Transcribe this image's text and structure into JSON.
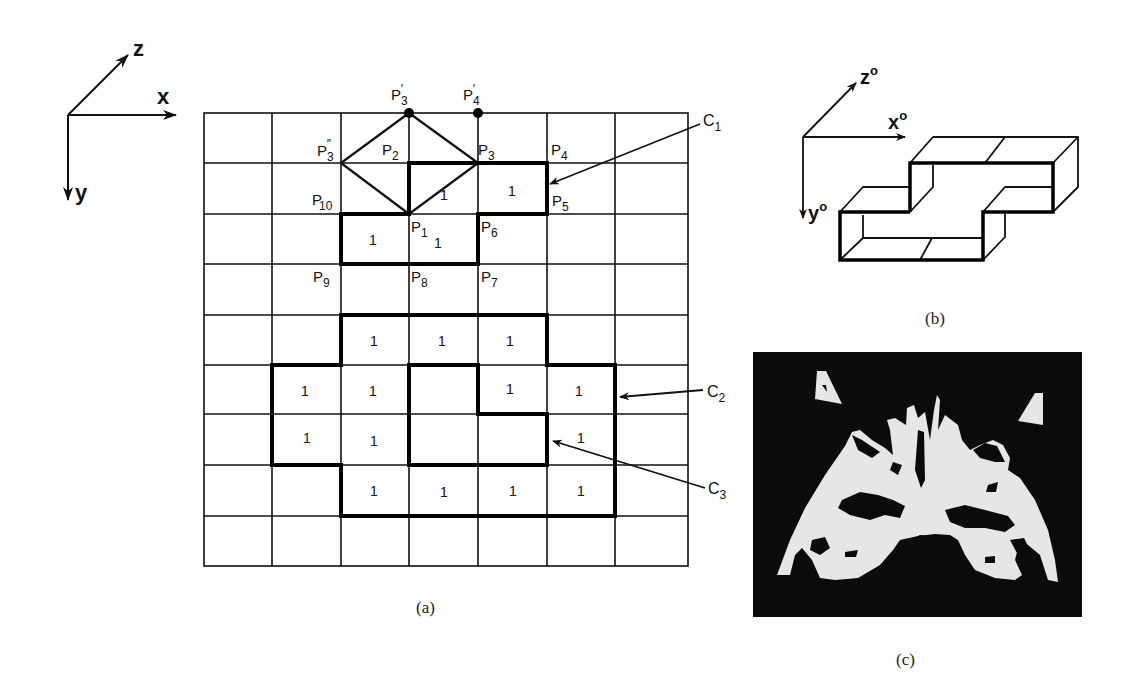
{
  "figure": {
    "panel_a": {
      "caption": "(a)",
      "axes": {
        "x": "x",
        "y": "y",
        "z": "z"
      },
      "grid": {
        "cols": 7,
        "rows": 9,
        "x_lines": [
          204,
          272,
          341,
          409,
          478,
          547,
          615,
          688
        ],
        "y_lines": [
          113,
          163,
          214,
          264,
          315,
          365,
          414,
          465,
          516,
          566
        ]
      },
      "points": {
        "P3_prime": "P",
        "P3_prime_sub": "3",
        "P3_prime_mark": "′",
        "P4_prime": "P",
        "P4_prime_sub": "4",
        "P4_prime_mark": "′",
        "P3_dprime": "P",
        "P3_dprime_sub": "3",
        "P3_dprime_mark": "″",
        "P1": "P",
        "P1_sub": "1",
        "P2": "P",
        "P2_sub": "2",
        "P3": "P",
        "P3_sub": "3",
        "P4": "P",
        "P4_sub": "4",
        "P5": "P",
        "P5_sub": "5",
        "P6": "P",
        "P6_sub": "6",
        "P7": "P",
        "P7_sub": "7",
        "P8": "P",
        "P8_sub": "8",
        "P9": "P",
        "P9_sub": "9",
        "P10": "P",
        "P10_sub": "10"
      },
      "cell_value": "1",
      "cells_marked": [
        [
          1,
          3
        ],
        [
          1,
          4
        ],
        [
          2,
          2
        ],
        [
          2,
          3
        ],
        [
          4,
          2
        ],
        [
          4,
          3
        ],
        [
          4,
          4
        ],
        [
          5,
          1
        ],
        [
          5,
          2
        ],
        [
          5,
          4
        ],
        [
          5,
          5
        ],
        [
          6,
          1
        ],
        [
          6,
          2
        ],
        [
          6,
          5
        ],
        [
          7,
          2
        ],
        [
          7,
          3
        ],
        [
          7,
          4
        ],
        [
          7,
          5
        ]
      ],
      "contours": {
        "C1": {
          "label": "C",
          "sub": "1"
        },
        "C2": {
          "label": "C",
          "sub": "2"
        },
        "C3": {
          "label": "C",
          "sub": "3"
        }
      }
    },
    "panel_b": {
      "caption": "(b)",
      "axes": {
        "x": "x",
        "y": "y",
        "z": "z",
        "sup": "o"
      }
    },
    "panel_c": {
      "caption": "(c)",
      "description": "binary CT slice image"
    }
  }
}
